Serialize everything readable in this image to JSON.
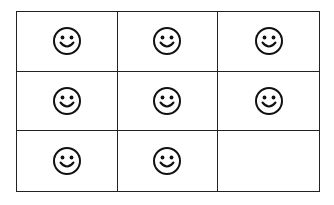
{
  "grid": {
    "rows": 3,
    "columns": 3,
    "line_color": "#222222",
    "cells": [
      {
        "icon": "smiley-icon",
        "filled": true
      },
      {
        "icon": "smiley-icon",
        "filled": true
      },
      {
        "icon": "smiley-icon",
        "filled": true
      },
      {
        "icon": "smiley-icon",
        "filled": true
      },
      {
        "icon": "smiley-icon",
        "filled": true
      },
      {
        "icon": "smiley-icon",
        "filled": true
      },
      {
        "icon": "smiley-icon",
        "filled": true
      },
      {
        "icon": "smiley-icon",
        "filled": true
      },
      {
        "icon": null,
        "filled": false
      }
    ],
    "smiley_count": 8
  }
}
